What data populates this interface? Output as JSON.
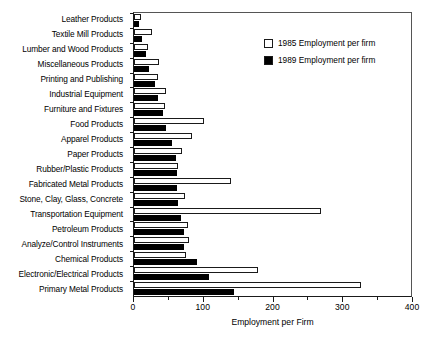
{
  "chart_data": {
    "type": "bar",
    "orientation": "horizontal",
    "title": "",
    "xlabel": "Employment per Firm",
    "ylabel": "",
    "xlim": [
      0,
      400
    ],
    "xticks": [
      0,
      100,
      200,
      300,
      400
    ],
    "xtick_labels": [
      "0",
      "100",
      "200",
      "300",
      "400"
    ],
    "xminorticks": [
      50,
      150,
      250,
      350
    ],
    "grid": false,
    "legend_position": "top-right",
    "categories": [
      "Leather Products",
      "Textile Mill Products",
      "Lumber and Wood Products",
      "Miscellaneous Products",
      "Printing and Publishing",
      "Industrial Equipment",
      "Furniture and Fixtures",
      "Food Products",
      "Apparel Products",
      "Paper Products",
      "Rubber/Plastic Products",
      "Fabricated Metal Products",
      "Stone, Clay, Glass, Concrete",
      "Transportation Equipment",
      "Petroleum Products",
      "Analyze/Control Instruments",
      "Chemical Products",
      "Electronic/Electrical Products",
      "Primary Metal Products"
    ],
    "series": [
      {
        "name": "1985 Employment per firm",
        "color": "#ffffff",
        "edge_color": "#1a1a1a",
        "values": [
          10,
          26,
          20,
          36,
          35,
          46,
          44,
          100,
          83,
          69,
          63,
          139,
          73,
          268,
          78,
          79,
          75,
          178,
          325
        ]
      },
      {
        "name": "1989 Employment per firm",
        "color": "#000000",
        "edge_color": "#000000",
        "values": [
          7,
          11,
          17,
          21,
          30,
          35,
          42,
          46,
          54,
          60,
          62,
          62,
          63,
          68,
          72,
          72,
          91,
          107,
          143
        ]
      }
    ]
  },
  "legend": {
    "items": [
      {
        "label": "1985 Employment per firm",
        "swatch": "open-square-swatch"
      },
      {
        "label": "1989 Employment per firm",
        "swatch": "filled-square-swatch"
      }
    ]
  }
}
